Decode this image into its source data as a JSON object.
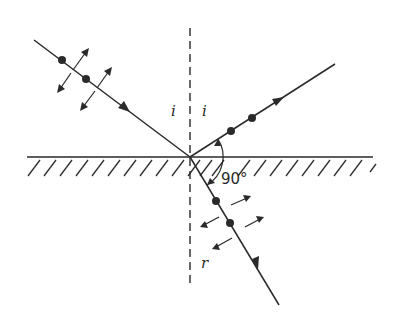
{
  "diagram": {
    "type": "optics-brewster-angle",
    "labels": {
      "incident_angle_left": "i",
      "incident_angle_right": "i",
      "refraction_angle": "r",
      "right_angle": "90°"
    },
    "elements": {
      "incident_ray": {
        "polarization": "dots and double-headed arrows (unpolarized)"
      },
      "reflected_ray": {
        "polarization": "dots only (s-polarized)"
      },
      "refracted_ray": {
        "polarization": "dots and double-headed arrows (partially polarized)"
      },
      "normal": "dashed vertical line",
      "interface": "hatched horizontal surface"
    },
    "colors": {
      "stroke": "#2a2a2a",
      "background": "#ffffff"
    }
  }
}
